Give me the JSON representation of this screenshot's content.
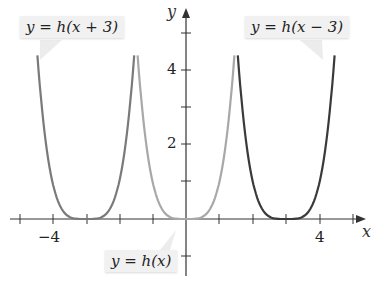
{
  "chart_data": {
    "type": "line",
    "title": "",
    "xlabel": "x",
    "ylabel": "y",
    "xlim": [
      -5.2,
      5.5
    ],
    "ylim": [
      -1.5,
      5.7
    ],
    "x_ticks": [
      -5,
      -4,
      -3,
      -2,
      -1,
      1,
      2,
      3,
      4,
      5
    ],
    "x_tick_labels": {
      "-4": "-4",
      "4": "4"
    },
    "y_ticks": [
      -1,
      1,
      2,
      3,
      4,
      5
    ],
    "y_tick_labels": {
      "2": "2",
      "4": "4"
    },
    "series": [
      {
        "name": "y = h(x + 3)",
        "function": "(x+3)^4",
        "color": "#7a7a7a",
        "vertex": [
          -3,
          0
        ]
      },
      {
        "name": "y = h(x)",
        "function": "x^4",
        "color": "#a8a8a8",
        "vertex": [
          0,
          0
        ]
      },
      {
        "name": "y = h(x − 3)",
        "function": "(x-3)^4",
        "color": "#3a3a3a",
        "vertex": [
          3,
          0
        ]
      }
    ],
    "grid": false,
    "legend": "callout labels"
  },
  "labels": {
    "shift_left": "y = h(x + 3)",
    "shift_right": "y = h(x − 3)",
    "base": "y = h(x)"
  },
  "axes": {
    "x_label": "x",
    "y_label": "y",
    "tick_neg4": "−4",
    "tick_4": "4",
    "tick_2": "2",
    "tick_y4": "4"
  }
}
